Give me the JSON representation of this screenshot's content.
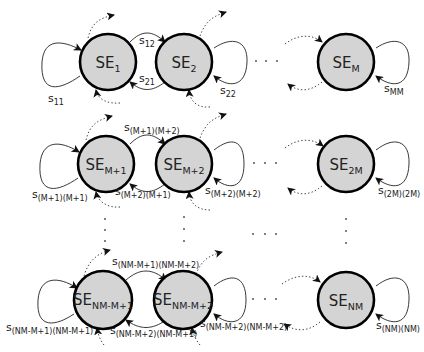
{
  "diagram": {
    "title": "",
    "node_prefix": "SE",
    "edge_prefix": "s",
    "rows": [
      {
        "nodes": [
          {
            "id": "SE_1",
            "base": "SE",
            "sub": "1"
          },
          {
            "id": "SE_2",
            "base": "SE",
            "sub": "2"
          },
          {
            "id": "SE_M",
            "base": "SE",
            "sub": "M"
          }
        ],
        "edges": [
          {
            "from": "SE_1",
            "to": "SE_1",
            "base": "s",
            "sub": "11"
          },
          {
            "from": "SE_1",
            "to": "SE_2",
            "base": "s",
            "sub": "12"
          },
          {
            "from": "SE_2",
            "to": "SE_1",
            "base": "s",
            "sub": "21"
          },
          {
            "from": "SE_2",
            "to": "SE_2",
            "base": "s",
            "sub": "22"
          },
          {
            "from": "SE_M",
            "to": "SE_M",
            "base": "s",
            "sub": "MM"
          }
        ]
      },
      {
        "nodes": [
          {
            "id": "SE_M+1",
            "base": "SE",
            "sub": "M+1"
          },
          {
            "id": "SE_M+2",
            "base": "SE",
            "sub": "M+2"
          },
          {
            "id": "SE_2M",
            "base": "SE",
            "sub": "2M"
          }
        ],
        "edges": [
          {
            "from": "SE_M+1",
            "to": "SE_M+1",
            "base": "s",
            "sub": "(M+1)(M+1)"
          },
          {
            "from": "SE_M+1",
            "to": "SE_M+2",
            "base": "s",
            "sub": "(M+1)(M+2)"
          },
          {
            "from": "SE_M+2",
            "to": "SE_M+1",
            "base": "s",
            "sub": "(M+2)(M+1)"
          },
          {
            "from": "SE_M+2",
            "to": "SE_M+2",
            "base": "s",
            "sub": "(M+2)(M+2)"
          },
          {
            "from": "SE_2M",
            "to": "SE_2M",
            "base": "s",
            "sub": "(2M)(2M)"
          }
        ]
      },
      {
        "nodes": [
          {
            "id": "SE_NM-M+1",
            "base": "SE",
            "sub": "NM-M+1"
          },
          {
            "id": "SE_NM-M+2",
            "base": "SE",
            "sub": "NM-M+2"
          },
          {
            "id": "SE_NM",
            "base": "SE",
            "sub": "NM"
          }
        ],
        "edges": [
          {
            "from": "SE_NM-M+1",
            "to": "SE_NM-M+1",
            "base": "s",
            "sub": "(NM-M+1)(NM-M+1)"
          },
          {
            "from": "SE_NM-M+1",
            "to": "SE_NM-M+2",
            "base": "s",
            "sub": "(NM-M+1)(NM-M+2)"
          },
          {
            "from": "SE_NM-M+2",
            "to": "SE_NM-M+1",
            "base": "s",
            "sub": "(NM-M+2)(NM-M+1)"
          },
          {
            "from": "SE_NM-M+2",
            "to": "SE_NM-M+2",
            "base": "s",
            "sub": "(NM-M+2)(NM-M+2)"
          },
          {
            "from": "SE_NM",
            "to": "SE_NM",
            "base": "s",
            "sub": "(NM)(NM)"
          }
        ]
      }
    ],
    "ellipsis": "· · ·",
    "colors": {
      "node_fill": "#d4d4d4",
      "node_stroke": "#000000",
      "edge": "#222222",
      "background": "#ffffff"
    }
  }
}
